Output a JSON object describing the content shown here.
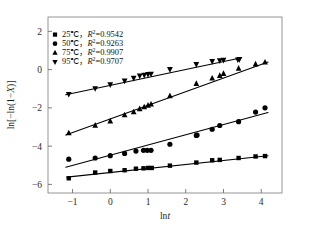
{
  "figure": {
    "background": "#ffffff",
    "ink_color": "#000000",
    "frame_color": "#8a8a8a"
  },
  "chart_data": {
    "type": "scatter",
    "title": "",
    "xlabel": "lnt",
    "xlabel_parts": {
      "prefix": "ln",
      "italic": "t"
    },
    "ylabel": "ln[-ln(1-X)]",
    "ylabel_parts": {
      "prefix": "ln[−ln(1−",
      "italic": "X",
      "suffix": ")]"
    },
    "xlim": [
      -1.65,
      4.55
    ],
    "ylim": [
      -6.45,
      2.75
    ],
    "xticks": [
      -1,
      0,
      1,
      2,
      3,
      4
    ],
    "xticklabels": [
      "−1",
      "0",
      "1",
      "2",
      "3",
      "4"
    ],
    "yticks": [
      2,
      0,
      -2,
      -4,
      -6
    ],
    "yticklabels": [
      "2",
      "0",
      "−2",
      "−4",
      "−6"
    ],
    "grid": false,
    "legend_position": "upper-left",
    "series": [
      {
        "name": "25℃",
        "label_temp": "25℃",
        "r_squared": "0.9542",
        "marker": "square",
        "x": [
          -1.1,
          -0.4,
          0.0,
          0.38,
          0.68,
          0.88,
          1.0,
          1.1,
          1.58,
          2.28,
          2.7,
          2.9,
          3.4,
          3.85,
          4.1
        ],
        "y": [
          -5.68,
          -5.38,
          -5.3,
          -5.26,
          -5.18,
          -5.16,
          -5.14,
          -5.14,
          -5.02,
          -4.86,
          -4.74,
          -4.72,
          -4.62,
          -4.54,
          -4.52
        ],
        "fit": {
          "x0": -1.15,
          "y0": -5.62,
          "x1": 4.18,
          "y1": -4.5
        }
      },
      {
        "name": "50℃",
        "label_temp": "50℃",
        "r_squared": "0.9263",
        "marker": "circle",
        "x": [
          -1.1,
          -0.4,
          0.0,
          0.38,
          0.68,
          0.88,
          0.98,
          1.08,
          1.58,
          2.28,
          2.3,
          2.7,
          2.9,
          3.4,
          3.85,
          4.1
        ],
        "y": [
          -4.68,
          -4.62,
          -4.5,
          -4.38,
          -4.26,
          -4.22,
          -4.22,
          -4.22,
          -3.9,
          -3.44,
          -3.42,
          -3.12,
          -2.92,
          -2.72,
          -2.22,
          -2.0
        ],
        "fit": {
          "x0": -1.18,
          "y0": -5.1,
          "x1": 4.18,
          "y1": -2.24
        }
      },
      {
        "name": "75℃",
        "label_temp": "75℃",
        "r_squared": "0.9907",
        "marker": "triangle-up",
        "x": [
          -1.1,
          -0.4,
          0.0,
          0.38,
          0.62,
          0.78,
          0.9,
          1.0,
          1.08,
          1.58,
          2.28,
          2.7,
          2.9,
          3.0,
          3.4,
          3.85,
          4.1
        ],
        "y": [
          -3.32,
          -2.92,
          -2.7,
          -2.38,
          -2.22,
          -2.06,
          -1.96,
          -1.88,
          -1.82,
          -1.38,
          -0.74,
          -0.46,
          -0.32,
          -0.22,
          0.06,
          0.28,
          0.38
        ],
        "fit": {
          "x0": -1.18,
          "y0": -3.42,
          "x1": 4.18,
          "y1": 0.4
        }
      },
      {
        "name": "95℃",
        "label_temp": "95℃",
        "r_squared": "0.9707",
        "marker": "triangle-down",
        "x": [
          -1.1,
          -0.4,
          0.0,
          0.38,
          0.62,
          0.78,
          0.9,
          1.0,
          1.08,
          1.58,
          2.28,
          2.7,
          2.9,
          3.0,
          3.38,
          3.42
        ],
        "y": [
          -1.28,
          -0.98,
          -0.78,
          -0.58,
          -0.44,
          -0.32,
          -0.28,
          -0.24,
          -0.22,
          0.02,
          0.28,
          0.44,
          0.48,
          0.5,
          0.52,
          0.54
        ],
        "fit": {
          "x0": -1.18,
          "y0": -1.32,
          "x1": 3.48,
          "y1": 0.62
        }
      }
    ]
  },
  "legend": {
    "entries": [
      {
        "marker": "square",
        "text": "25℃，R²=0.9542",
        "temp": "25℃",
        "sep": "，",
        "r_label": "R",
        "r_exp": "2",
        "eq": "=0.9542"
      },
      {
        "marker": "circle",
        "text": "50℃，R²=0.9263",
        "temp": "50℃",
        "sep": "，",
        "r_label": "R",
        "r_exp": "2",
        "eq": "=0.9263"
      },
      {
        "marker": "triangle-up",
        "text": "75℃，R²=0.9907",
        "temp": "75℃",
        "sep": "，",
        "r_label": "R",
        "r_exp": "2",
        "eq": "=0.9907"
      },
      {
        "marker": "triangle-down",
        "text": "95℃，R²=0.9707",
        "temp": "95℃",
        "sep": "，",
        "r_label": "R",
        "r_exp": "2",
        "eq": "=0.9707"
      }
    ]
  }
}
